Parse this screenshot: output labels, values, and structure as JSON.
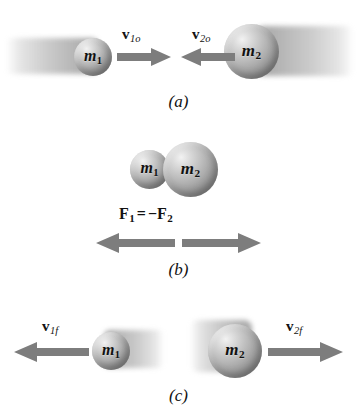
{
  "figure": {
    "background_color": "#ffffff",
    "sphere_color": "#a6a6a6",
    "arrow_color": "#7a7a7a",
    "text_color": "#121212"
  },
  "panels": [
    {
      "id": "a",
      "caption": "(a)",
      "description": "Before collision: masses approach each other",
      "bodies": [
        {
          "name": "mass-1",
          "symbol": "m",
          "subscript": "1",
          "size": "small",
          "motion": "right"
        },
        {
          "name": "mass-2",
          "symbol": "m",
          "subscript": "2",
          "size": "large",
          "motion": "left"
        }
      ],
      "vectors": [
        {
          "name": "velocity-1-initial",
          "symbol": "v",
          "subscript": "1o",
          "direction": "right"
        },
        {
          "name": "velocity-2-initial",
          "symbol": "v",
          "subscript": "2o",
          "direction": "left"
        }
      ]
    },
    {
      "id": "b",
      "caption": "(b)",
      "description": "During collision: contact forces are equal and opposite",
      "bodies": [
        {
          "name": "mass-1",
          "symbol": "m",
          "subscript": "1",
          "size": "small",
          "motion": "none"
        },
        {
          "name": "mass-2",
          "symbol": "m",
          "subscript": "2",
          "size": "large",
          "motion": "none"
        }
      ],
      "equation": {
        "name": "newtons-third-law-equation",
        "lhs_symbol": "F",
        "lhs_subscript": "1",
        "operator": "=",
        "sign": "−",
        "rhs_symbol": "F",
        "rhs_subscript": "2",
        "plain": "F1 = -F2"
      },
      "vectors": [
        {
          "name": "force-on-1",
          "direction": "left"
        },
        {
          "name": "force-on-2",
          "direction": "right"
        }
      ]
    },
    {
      "id": "c",
      "caption": "(c)",
      "description": "After collision: masses separate",
      "bodies": [
        {
          "name": "mass-1",
          "symbol": "m",
          "subscript": "1",
          "size": "small",
          "motion": "left"
        },
        {
          "name": "mass-2",
          "symbol": "m",
          "subscript": "2",
          "size": "large",
          "motion": "right"
        }
      ],
      "vectors": [
        {
          "name": "velocity-1-final",
          "symbol": "v",
          "subscript": "1f",
          "direction": "left"
        },
        {
          "name": "velocity-2-final",
          "symbol": "v",
          "subscript": "2f",
          "direction": "right"
        }
      ]
    }
  ]
}
